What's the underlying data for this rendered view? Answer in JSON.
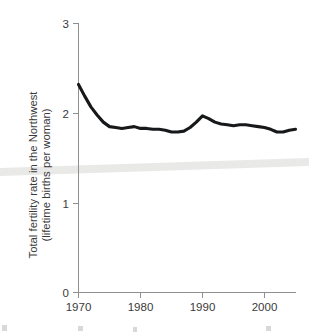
{
  "chart_data": {
    "type": "line",
    "title": "",
    "xlabel": "",
    "ylabel": "Total fertility rate in the Northwest (lifetime births per woman)",
    "ylabel_line1": "Total fertility rate in the Northwest",
    "ylabel_line2": "(lifetime births per woman)",
    "xlim": [
      1970,
      2005
    ],
    "ylim": [
      0,
      3
    ],
    "grid": false,
    "legend": "none",
    "line_color": "#16181a",
    "axis_color": "#8f8f8f",
    "y_ticks": [
      "0",
      "1",
      "2",
      "3"
    ],
    "y_tick_values": [
      0,
      1,
      2,
      3
    ],
    "x_ticks": [
      "1970",
      "1980",
      "1990",
      "2000"
    ],
    "x_tick_values": [
      1970,
      1980,
      1990,
      2000
    ],
    "x": [
      1970,
      1971,
      1972,
      1973,
      1974,
      1975,
      1976,
      1977,
      1978,
      1979,
      1980,
      1981,
      1982,
      1983,
      1984,
      1985,
      1986,
      1987,
      1988,
      1989,
      1990,
      1991,
      1992,
      1993,
      1994,
      1995,
      1996,
      1997,
      1998,
      1999,
      2000,
      2001,
      2002,
      2003,
      2004,
      2005
    ],
    "values": [
      2.32,
      2.19,
      2.07,
      1.98,
      1.9,
      1.85,
      1.84,
      1.83,
      1.84,
      1.85,
      1.83,
      1.83,
      1.82,
      1.82,
      1.81,
      1.79,
      1.79,
      1.8,
      1.84,
      1.9,
      1.97,
      1.94,
      1.9,
      1.88,
      1.87,
      1.86,
      1.87,
      1.87,
      1.86,
      1.85,
      1.84,
      1.82,
      1.79,
      1.79,
      1.81,
      1.82
    ],
    "series": [
      {
        "name": "Total fertility rate in the Northwest",
        "values": [
          2.32,
          2.19,
          2.07,
          1.98,
          1.9,
          1.85,
          1.84,
          1.83,
          1.84,
          1.85,
          1.83,
          1.83,
          1.82,
          1.82,
          1.81,
          1.79,
          1.79,
          1.8,
          1.84,
          1.9,
          1.97,
          1.94,
          1.9,
          1.88,
          1.87,
          1.86,
          1.87,
          1.87,
          1.86,
          1.85,
          1.84,
          1.82,
          1.79,
          1.79,
          1.81,
          1.82
        ]
      }
    ],
    "annotations": []
  }
}
